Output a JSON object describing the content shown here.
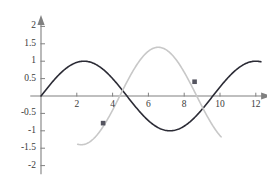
{
  "chart_data": {
    "type": "line",
    "title": "",
    "subtitle": "",
    "xlabel": "",
    "ylabel": "",
    "xlim": [
      -0.6,
      12.8
    ],
    "ylim": [
      -2.25,
      2.3
    ],
    "grid": false,
    "legend": "none",
    "x_ticks": [
      2,
      4,
      6,
      8,
      10,
      12
    ],
    "x_tick_labels": [
      "2",
      "4",
      "6",
      "8",
      "10",
      "12"
    ],
    "y_ticks": [
      2,
      1.5,
      1,
      0.5,
      -0.5,
      -1,
      -1.5,
      -2
    ],
    "y_tick_labels": [
      "2",
      "1.5",
      "1",
      "0.5",
      "-0.5",
      "-1",
      "-1.5",
      "-2"
    ],
    "axis_color": "#808080",
    "series": [
      {
        "name": "dark-sine",
        "color": "#2b2b35",
        "width": 1.6,
        "amplitude": 1.0,
        "period": 9.6,
        "phase": 0.0,
        "x_start": 0.0,
        "x_end": 12.3,
        "description": "sine curve amplitude 1, zero at x=0, peak ~1.7, trough ~6.5, peak ~7.9"
      },
      {
        "name": "light-sine",
        "color": "#c8c8c8",
        "width": 1.6,
        "amplitude": 1.4,
        "period": 8.6,
        "phase": 4.4,
        "x_start": 2.05,
        "x_end": 10.1,
        "description": "light gray sine, amplitude ~1.4, peak ~1.4 near x=6.8, clipped at +-2"
      }
    ],
    "points": [
      {
        "name": "point-a",
        "x": 3.47,
        "y": -0.78,
        "color": "#555560"
      },
      {
        "name": "point-b",
        "x": 8.58,
        "y": 0.41,
        "color": "#555560"
      }
    ]
  }
}
